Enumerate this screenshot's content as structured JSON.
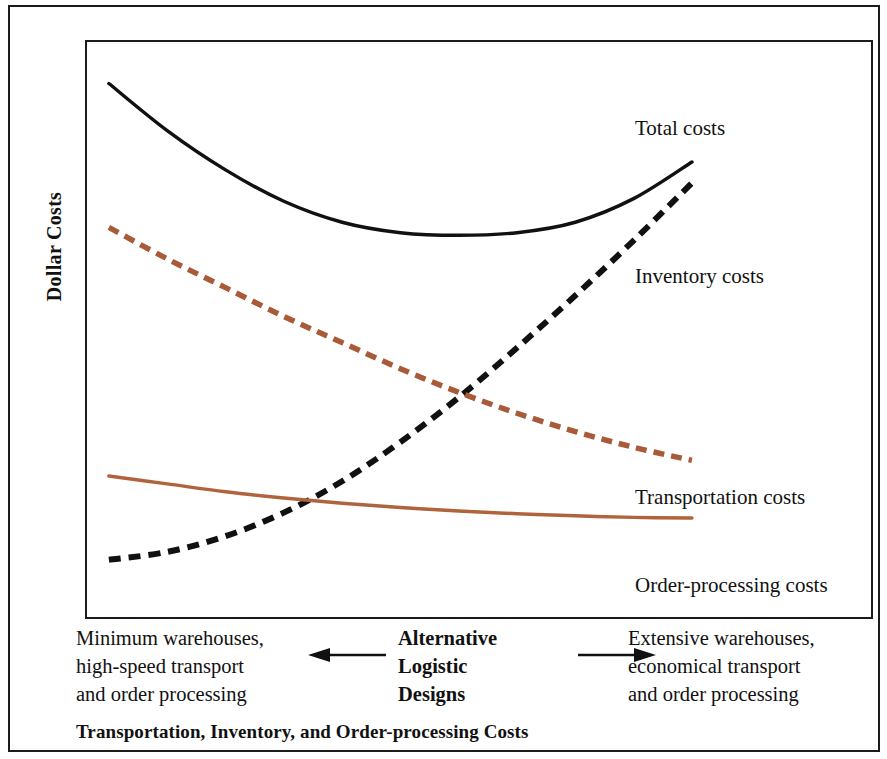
{
  "figure": {
    "caption": "Transportation, Inventory, and Order-processing Costs",
    "y_axis_title": "Dollar Costs"
  },
  "axis_descriptor": {
    "center_title_line1": "Alternative",
    "center_title_line2": "Logistic",
    "center_title_line3": "Designs",
    "left_line1": "Minimum warehouses,",
    "left_line2": "high-speed transport",
    "left_line3": "and order processing",
    "right_line1": "Extensive warehouses,",
    "right_line2": "economical transport",
    "right_line3": "and order processing",
    "left_arrow_icon": "arrow-left-icon",
    "right_arrow_icon": "arrow-right-icon"
  },
  "series_labels": {
    "total": "Total costs",
    "inventory": "Inventory costs",
    "transportation": "Transportation costs",
    "order_processing": "Order-processing costs"
  },
  "colors": {
    "total_costs": "#111111",
    "inventory_costs": "#111111",
    "transportation_costs": "#A85A39",
    "order_processing_costs": "#B0643E",
    "frame": "#1b1b1b",
    "background": "#ffffff"
  },
  "chart_data": {
    "type": "line",
    "title": "Transportation, Inventory, and Order-processing Costs",
    "xlabel": "Alternative Logistic Designs",
    "ylabel": "Dollar Costs",
    "grid": false,
    "legend_position": "right-inline-annotations",
    "axis_ticks_shown": false,
    "xlim": [
      0,
      100
    ],
    "ylim": [
      0,
      100
    ],
    "x_axis_left_description": "Minimum warehouses, high-speed transport and order processing",
    "x_axis_right_description": "Extensive warehouses, economical transport and order processing",
    "x": [
      0,
      10,
      20,
      30,
      40,
      50,
      60,
      70,
      80,
      90,
      100
    ],
    "series": [
      {
        "name": "Total costs",
        "style": "solid",
        "color": "#111111",
        "width": 3.5,
        "values": [
          97,
          88,
          80.5,
          74.5,
          70.5,
          68.5,
          68,
          68.5,
          70.5,
          75,
          82
        ]
      },
      {
        "name": "Inventory costs",
        "style": "dashed",
        "color": "#111111",
        "width": 6,
        "values": [
          6,
          7.5,
          10.5,
          15,
          21,
          28.5,
          37,
          46.5,
          56.5,
          67,
          78
        ]
      },
      {
        "name": "Transportation costs",
        "style": "dashed",
        "color": "#A85A39",
        "width": 5.5,
        "values": [
          69.5,
          63.5,
          58,
          52.5,
          47.5,
          42.5,
          38,
          34,
          30.5,
          27.5,
          25
        ]
      },
      {
        "name": "Order-processing costs",
        "style": "solid",
        "color": "#B0643E",
        "width": 3.5,
        "values": [
          22,
          20.5,
          19,
          17.8,
          16.8,
          16,
          15.3,
          14.8,
          14.4,
          14.1,
          14
        ]
      }
    ],
    "annotations": [
      {
        "text": "Total costs",
        "attached_to": "Total costs",
        "position": "right-end"
      },
      {
        "text": "Inventory costs",
        "attached_to": "Inventory costs",
        "position": "right-end"
      },
      {
        "text": "Transportation costs",
        "attached_to": "Transportation costs",
        "position": "right-end"
      },
      {
        "text": "Order-processing costs",
        "attached_to": "Order-processing costs",
        "position": "right-end"
      }
    ]
  }
}
